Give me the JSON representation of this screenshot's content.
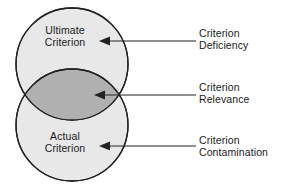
{
  "diagram": {
    "background_color": "#ffffff",
    "stroke_color": "#222222",
    "circle_fill": "#e8e8e8",
    "overlap_fill": "#b0b0b0",
    "text_color": "#1a1a1a",
    "circles": [
      {
        "id": "ultimate",
        "label_line1": "Ultimate",
        "label_line2": "Criterion",
        "cx": 72,
        "cy": 64,
        "r": 56,
        "fill": "#e8e8e8"
      },
      {
        "id": "actual",
        "label_line1": "Actual",
        "label_line2": "Criterion",
        "cx": 72,
        "cy": 125,
        "r": 56,
        "fill": "#e8e8e8"
      }
    ],
    "overlap": {
      "id": "relevance-lens",
      "fill": "#b0b0b0",
      "top_y": 68,
      "bottom_y": 122
    },
    "callouts": [
      {
        "id": "deficiency",
        "line1": "Criterion",
        "line2": "Deficiency",
        "arrow_tip_x": 100,
        "arrow_tail_x": 196,
        "arrow_y": 41,
        "target": "ultimate"
      },
      {
        "id": "relevance",
        "line1": "Criterion",
        "line2": "Relevance",
        "arrow_tip_x": 95,
        "arrow_tail_x": 196,
        "arrow_y": 95,
        "target": "overlap"
      },
      {
        "id": "contamination",
        "line1": "Criterion",
        "line2": "Contamination",
        "arrow_tip_x": 100,
        "arrow_tail_x": 196,
        "arrow_y": 146,
        "target": "actual"
      }
    ]
  }
}
